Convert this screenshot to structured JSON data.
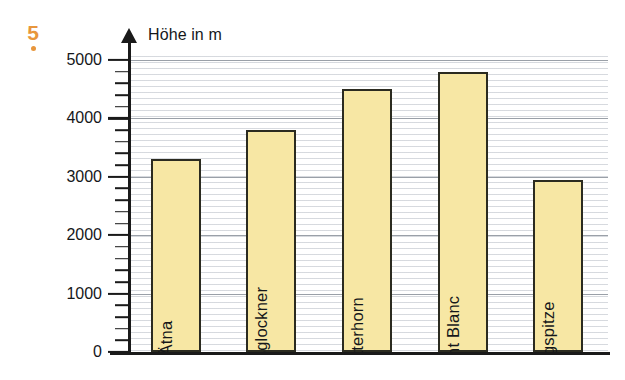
{
  "exercise": {
    "number": "5"
  },
  "chart_data": {
    "type": "bar",
    "title": "",
    "axis_label_y": "Höhe in m",
    "xlabel": "",
    "ylabel": "Höhe in m",
    "ylim": [
      0,
      5000
    ],
    "ytick_values": [
      0,
      1000,
      2000,
      3000,
      4000,
      5000
    ],
    "ytick_labels": [
      "0",
      "1000",
      "2000",
      "3000",
      "4000",
      "5000"
    ],
    "minor_tick_step": 200,
    "grid": true,
    "legend": false,
    "categories": [
      "Ätna",
      "Großglockner",
      "Matterhorn",
      "Mont Blanc",
      "Zugspitze"
    ],
    "values": [
      3300,
      3800,
      4500,
      4800,
      2950
    ],
    "bar_fill_color": "#f7e7a4",
    "bar_border_color": "#2b2b20",
    "accent_color": "#e8963c"
  }
}
